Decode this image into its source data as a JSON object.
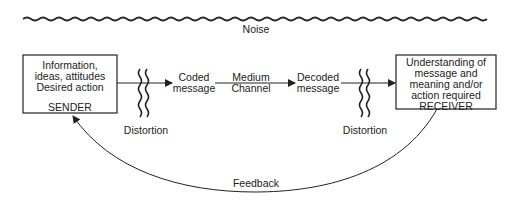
{
  "noise": {
    "label": "Noise"
  },
  "sender": {
    "lines": [
      "Information,",
      "ideas, attitudes",
      "Desired action"
    ],
    "role": "SENDER"
  },
  "receiver": {
    "lines": [
      "Understanding of",
      "message and",
      "meaning and/or",
      "action required"
    ],
    "role": "RECEIVER"
  },
  "flow": {
    "coded": [
      "Coded",
      "message"
    ],
    "medium": [
      "Medium",
      "Channel"
    ],
    "decoded": [
      "Decoded",
      "message"
    ]
  },
  "distortion": {
    "left": "Distortion",
    "right": "Distortion"
  },
  "feedback": {
    "label": "Feedback"
  },
  "colors": {
    "stroke": "#222222",
    "background": "#ffffff"
  }
}
